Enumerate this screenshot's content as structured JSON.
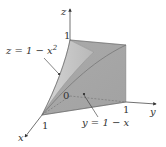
{
  "figure": {
    "type": "3d-solid-region",
    "axes": {
      "x": {
        "label": "x",
        "tick": "1"
      },
      "y": {
        "label": "y",
        "tick": "1"
      },
      "z": {
        "label": "z",
        "tick": "1"
      },
      "origin": "0"
    },
    "surfaces": [
      {
        "name": "parabolic-cylinder",
        "equation_lhs": "z = 1 − x",
        "equation_exp": "2"
      },
      {
        "name": "plane",
        "equation": "y = 1 − x"
      }
    ],
    "colors": {
      "front_face": "#a9a9a9",
      "side_face": "#c4c4c4",
      "top_face": "#9a9a9a",
      "axis": "#444444",
      "text": "#333333"
    }
  }
}
